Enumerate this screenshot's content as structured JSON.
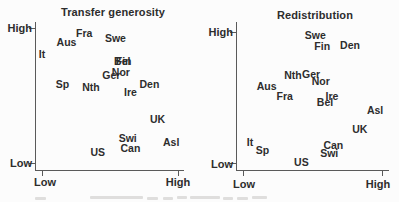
{
  "background_color": "#fcfcfc",
  "text_color": "#2d2d2d",
  "axis_color": "#5a5a5a",
  "chart_data": [
    {
      "type": "scatter",
      "title": "Transfer generosity",
      "x_axis": {
        "low_label": "Low",
        "high_label": "High"
      },
      "y_axis": {
        "high_label": "High",
        "low_label": "Low"
      },
      "axis_scale": "qualitative Low-to-High, no numeric ticks; values normalized 0-1",
      "point_style": "country abbreviation text labels",
      "points": [
        {
          "label": "It",
          "x": 0.0,
          "y": 0.81
        },
        {
          "label": "Aus",
          "x": 0.18,
          "y": 0.9
        },
        {
          "label": "Fra",
          "x": 0.31,
          "y": 0.97
        },
        {
          "label": "Swe",
          "x": 0.54,
          "y": 0.93
        },
        {
          "label": "Fin",
          "x": 0.6,
          "y": 0.76
        },
        {
          "label": "Bel",
          "x": 0.59,
          "y": 0.76
        },
        {
          "label": "Nor",
          "x": 0.58,
          "y": 0.68
        },
        {
          "label": "Ger",
          "x": 0.51,
          "y": 0.66
        },
        {
          "label": "Sp",
          "x": 0.15,
          "y": 0.59
        },
        {
          "label": "Nth",
          "x": 0.36,
          "y": 0.57
        },
        {
          "label": "Den",
          "x": 0.79,
          "y": 0.59
        },
        {
          "label": "Ire",
          "x": 0.65,
          "y": 0.53
        },
        {
          "label": "UK",
          "x": 0.85,
          "y": 0.33
        },
        {
          "label": "Swi",
          "x": 0.63,
          "y": 0.19
        },
        {
          "label": "Asl",
          "x": 0.95,
          "y": 0.16
        },
        {
          "label": "Can",
          "x": 0.65,
          "y": 0.11
        },
        {
          "label": "US",
          "x": 0.41,
          "y": 0.08
        }
      ]
    },
    {
      "type": "scatter",
      "title": "Redistribution",
      "x_axis": {
        "low_label": "Low",
        "high_label": "High"
      },
      "y_axis": {
        "high_label": "High",
        "low_label": "Low"
      },
      "axis_scale": "qualitative Low-to-High, no numeric ticks; values normalized 0-1",
      "point_style": "country abbreviation text labels",
      "points": [
        {
          "label": "Swe",
          "x": 0.52,
          "y": 0.98
        },
        {
          "label": "Fin",
          "x": 0.57,
          "y": 0.89
        },
        {
          "label": "Den",
          "x": 0.77,
          "y": 0.9
        },
        {
          "label": "Nth",
          "x": 0.36,
          "y": 0.67
        },
        {
          "label": "Ger",
          "x": 0.49,
          "y": 0.68
        },
        {
          "label": "Nor",
          "x": 0.56,
          "y": 0.63
        },
        {
          "label": "Aus",
          "x": 0.17,
          "y": 0.59
        },
        {
          "label": "Fra",
          "x": 0.3,
          "y": 0.51
        },
        {
          "label": "Ire",
          "x": 0.64,
          "y": 0.51
        },
        {
          "label": "Bel",
          "x": 0.59,
          "y": 0.47
        },
        {
          "label": "Asl",
          "x": 0.95,
          "y": 0.41
        },
        {
          "label": "UK",
          "x": 0.84,
          "y": 0.26
        },
        {
          "label": "It",
          "x": 0.05,
          "y": 0.16
        },
        {
          "label": "Sp",
          "x": 0.14,
          "y": 0.1
        },
        {
          "label": "Can",
          "x": 0.65,
          "y": 0.14
        },
        {
          "label": "Swi",
          "x": 0.62,
          "y": 0.08
        },
        {
          "label": "US",
          "x": 0.42,
          "y": 0.01
        }
      ]
    }
  ]
}
